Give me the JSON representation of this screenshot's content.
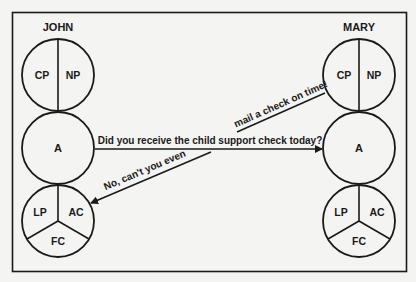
{
  "figure": {
    "left_person": {
      "name": "JOHN",
      "parent_circle": {
        "left": "CP",
        "right": "NP"
      },
      "adult_circle": {
        "label": "A"
      },
      "child_circle": {
        "left": "LP",
        "right": "AC",
        "bottom": "FC"
      }
    },
    "right_person": {
      "name": "MARY",
      "parent_circle": {
        "left": "CP",
        "right": "NP"
      },
      "adult_circle": {
        "label": "A"
      },
      "child_circle": {
        "left": "LP",
        "right": "AC",
        "bottom": "FC"
      }
    },
    "transactions": {
      "stimulus": "Did you receive the child support check today?",
      "response_upper": "mail a check on time!",
      "response_lower": "No, can't you even"
    },
    "colors": {
      "background": "#f4f4f2",
      "ink": "#1a1a1a"
    }
  }
}
